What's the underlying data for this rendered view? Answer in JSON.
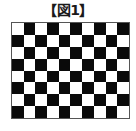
{
  "figure": {
    "title": "【図1】",
    "grid": {
      "columns": 10,
      "rows": 8,
      "pattern": "checkerboard",
      "top_left_color": "white",
      "colors": {
        "dark": "#0a0a0a",
        "light": "#ffffff",
        "border": "#555555"
      }
    }
  }
}
